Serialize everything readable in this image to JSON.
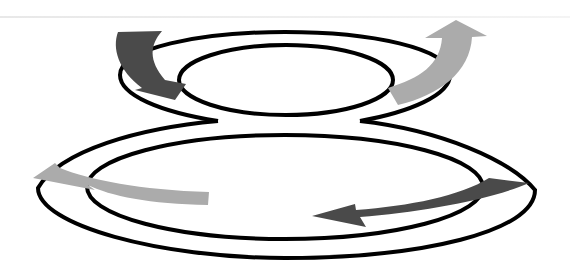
{
  "diagram": {
    "type": "figure-eight-double-loop",
    "colors": {
      "outline": "#000000",
      "dark_arrow": "#4a4a4a",
      "light_arrow": "#ababab",
      "background": "#ffffff"
    },
    "loops": [
      {
        "name": "upper-loop",
        "role": "small ring"
      },
      {
        "name": "lower-loop",
        "role": "large ring"
      }
    ],
    "arrows": [
      {
        "name": "upper-left-arrow",
        "shade": "dark",
        "direction": "down-right"
      },
      {
        "name": "upper-right-arrow",
        "shade": "light",
        "direction": "up-right"
      },
      {
        "name": "lower-left-arrow",
        "shade": "light",
        "direction": "left"
      },
      {
        "name": "lower-right-arrow",
        "shade": "dark",
        "direction": "left"
      }
    ]
  }
}
